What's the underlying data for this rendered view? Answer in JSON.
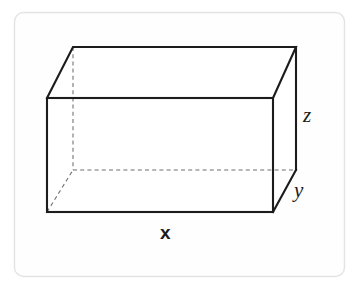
{
  "figure": {
    "type": "geometry-diagram",
    "shape_name": "rectangular prism",
    "canvas": {
      "width": 360,
      "height": 290
    },
    "colors": {
      "background": "#ffffff",
      "frame_border": "#e3e3e3",
      "visible_edge": "#1c1c1c",
      "hidden_edge": "#6f6f6f",
      "label_text": "#1c1c1c",
      "face_fill": "#ffffff"
    },
    "frame": {
      "x": 14,
      "y": 12,
      "width": 331,
      "height": 265,
      "radius": 9
    },
    "vertices": {
      "front_top_left": [
        47,
        98
      ],
      "front_top_right": [
        273,
        98
      ],
      "front_bottom_right": [
        273,
        212
      ],
      "front_bottom_left": [
        47,
        212
      ],
      "back_top_left": [
        73,
        47
      ],
      "back_top_right": [
        296,
        47
      ],
      "back_bottom_right": [
        296,
        170
      ],
      "back_bottom_left": [
        73,
        170
      ]
    },
    "visible_edges": [
      "front_top_left-front_top_right",
      "front_top_right-front_bottom_right",
      "front_bottom_right-front_bottom_left",
      "front_bottom_left-front_top_left",
      "front_top_left-back_top_left",
      "front_top_right-back_top_right",
      "back_top_left-back_top_right",
      "back_top_right-back_bottom_right",
      "front_bottom_right-back_bottom_right"
    ],
    "hidden_edges": [
      "back_top_left-back_bottom_left",
      "back_bottom_left-back_bottom_right",
      "front_bottom_left-back_bottom_left"
    ],
    "labels": [
      {
        "key": "x",
        "text": "x",
        "style": "bold",
        "edge": "front-bottom (length)",
        "x": 160,
        "y": 223
      },
      {
        "key": "z",
        "text": "z",
        "style": "italic",
        "edge": "right-vertical (height)",
        "x": 303,
        "y": 105
      },
      {
        "key": "y",
        "text": "y",
        "style": "italic",
        "edge": "right-depth (depth)",
        "x": 294,
        "y": 180
      }
    ]
  }
}
